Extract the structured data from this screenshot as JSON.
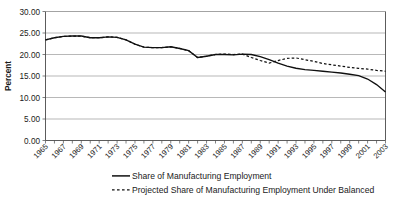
{
  "chart_data": {
    "type": "line",
    "title": "",
    "xlabel": "",
    "ylabel": "Percent",
    "ylim": [
      0,
      30
    ],
    "ytick_values": [
      0,
      5,
      10,
      15,
      20,
      25,
      30
    ],
    "ytick_labels": [
      "0.00",
      "5.00",
      "10.00",
      "15.00",
      "20.00",
      "25.00",
      "30.00"
    ],
    "grid": true,
    "legend_position": "bottom",
    "x": [
      1965,
      1966,
      1967,
      1968,
      1969,
      1970,
      1971,
      1972,
      1973,
      1974,
      1975,
      1976,
      1977,
      1978,
      1979,
      1980,
      1981,
      1982,
      1983,
      1984,
      1985,
      1986,
      1987,
      1988,
      1989,
      1990,
      1991,
      1992,
      1993,
      1994,
      1995,
      1996,
      1997,
      1998,
      1999,
      2000,
      2001,
      2002,
      2003
    ],
    "xtick_labels": [
      "1965",
      "1967",
      "1969",
      "1971",
      "1973",
      "1975",
      "1977",
      "1979",
      "1981",
      "1983",
      "1985",
      "1987",
      "1989",
      "1991",
      "1993",
      "1995",
      "1997",
      "1999",
      "2001",
      "2003"
    ],
    "xtick_values": [
      1965,
      1967,
      1969,
      1971,
      1973,
      1975,
      1977,
      1979,
      1981,
      1983,
      1985,
      1987,
      1989,
      1991,
      1993,
      1995,
      1997,
      1999,
      2001,
      2003
    ],
    "xlim": [
      1965,
      2003
    ],
    "series": [
      {
        "name": "Share of Manufacturing Employment",
        "style": "solid",
        "color": "#101010",
        "values": [
          23.4,
          23.9,
          24.2,
          24.3,
          24.3,
          23.9,
          23.9,
          24.1,
          24.0,
          23.5,
          22.4,
          21.7,
          21.6,
          21.6,
          21.8,
          21.4,
          20.9,
          19.3,
          19.6,
          20.0,
          20.0,
          19.9,
          20.1,
          20.1,
          19.8,
          19.3,
          18.7,
          18.1,
          17.4,
          17.1,
          17.2,
          17.1,
          16.5,
          16.1,
          15.6,
          15.4,
          15.3,
          15.0,
          14.6
        ]
      },
      {
        "name": "Projected Share of Manufacturing Employment Under Balanced",
        "style": "dashed",
        "color": "#101010",
        "values": [
          23.4,
          23.9,
          24.2,
          24.3,
          24.3,
          23.9,
          23.9,
          24.1,
          24.0,
          23.5,
          22.4,
          21.7,
          21.6,
          21.6,
          21.8,
          21.4,
          20.9,
          19.3,
          19.6,
          20.0,
          20.0,
          19.9,
          20.1,
          20.1,
          19.8,
          19.3,
          18.7,
          18.1,
          17.4,
          17.1,
          17.2,
          17.1,
          16.5,
          16.1,
          15.6,
          15.4,
          15.3,
          15.0,
          14.6
        ]
      }
    ],
    "legend": [
      {
        "label": "Share of Manufacturing Employment",
        "style": "solid"
      },
      {
        "label": "Projected Share of Manufacturing Employment Under Balanced",
        "style": "dashed"
      }
    ]
  },
  "series_actual": [
    23.4,
    23.9,
    24.2,
    24.3,
    24.3,
    23.9,
    23.9,
    24.1,
    24.0,
    23.4,
    22.4,
    21.7,
    21.6,
    21.6,
    21.8,
    21.4,
    20.9,
    19.3,
    19.6,
    20.0,
    20.0,
    19.9,
    20.1,
    20.0,
    19.5,
    18.8,
    18.0,
    17.3,
    16.8,
    16.5,
    16.3,
    16.1,
    15.9,
    15.7,
    15.4,
    15.1,
    14.3,
    13.0,
    11.3
  ],
  "series_projected": [
    23.4,
    23.9,
    24.2,
    24.3,
    24.3,
    23.9,
    23.9,
    24.1,
    24.0,
    23.4,
    22.4,
    21.7,
    21.6,
    21.6,
    21.8,
    21.4,
    20.9,
    19.3,
    19.6,
    20.0,
    20.1,
    20.0,
    20.1,
    19.3,
    18.6,
    18.0,
    18.6,
    19.1,
    19.2,
    18.8,
    18.4,
    17.9,
    17.6,
    17.3,
    17.0,
    16.8,
    16.6,
    16.3,
    16.1,
    15.9
  ]
}
